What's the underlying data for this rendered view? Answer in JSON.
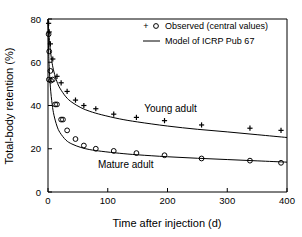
{
  "chart_data": {
    "type": "line",
    "title": "",
    "xlabel": "Time after injection (d)",
    "ylabel": "Total-body retention (%)",
    "xlim": [
      0,
      400
    ],
    "ylim": [
      0,
      80
    ],
    "xticks": [
      0,
      100,
      200,
      300,
      400
    ],
    "yticks": [
      0,
      20,
      40,
      60,
      80
    ],
    "grid": false,
    "legend_position": "top-right",
    "legend": [
      {
        "key": "observed",
        "label": "Observed (central values)",
        "markers": [
          "+",
          "o"
        ]
      },
      {
        "key": "model",
        "label": "Model of ICRP Pub 67",
        "markers": [
          "line"
        ]
      }
    ],
    "annotations": [
      {
        "key": "young-adult",
        "text": "Young adult",
        "x": 205,
        "y": 37
      },
      {
        "key": "mature-adult",
        "text": "Mature adult",
        "x": 130,
        "y": 11
      }
    ],
    "series": [
      {
        "name": "Young adult",
        "marker": "+",
        "observed": {
          "x": [
            1,
            2,
            4,
            8,
            15,
            22,
            32,
            46,
            60,
            80,
            110,
            148,
            195,
            257,
            338,
            390
          ],
          "y": [
            78.0,
            74.0,
            68.5,
            61.5,
            53.5,
            50.5,
            46.5,
            42.5,
            40.0,
            38.5,
            36.0,
            34.5,
            33.0,
            31.0,
            29.5,
            28.5
          ]
        },
        "model": {
          "x": [
            0,
            1,
            2,
            4,
            7,
            10,
            15,
            20,
            30,
            40,
            55,
            70,
            90,
            120,
            150,
            200,
            250,
            300,
            350,
            400
          ],
          "y": [
            80.0,
            75.5,
            71.5,
            65.5,
            59.5,
            55.5,
            51.0,
            48.0,
            44.0,
            41.5,
            39.0,
            37.3,
            35.7,
            33.8,
            32.4,
            30.5,
            29.0,
            27.8,
            26.5,
            25.2
          ]
        }
      },
      {
        "name": "Mature adult",
        "marker": "o",
        "observed": {
          "x": [
            1,
            2,
            4,
            8,
            15,
            22,
            32,
            46,
            60,
            80,
            110,
            148,
            195,
            257,
            338,
            390
          ],
          "y": [
            73.0,
            65.0,
            56.0,
            52.0,
            40.5,
            33.5,
            28.5,
            24.5,
            21.5,
            20.0,
            19.0,
            18.0,
            17.0,
            15.5,
            14.5,
            13.5
          ],
          "x_extra": [
            1.5,
            5,
            12,
            25
          ],
          "y_extra": [
            52.0,
            51.5,
            40.5,
            33.5
          ]
        },
        "model": {
          "x": [
            0,
            1,
            2,
            4,
            7,
            10,
            15,
            20,
            30,
            40,
            55,
            70,
            90,
            120,
            150,
            200,
            250,
            300,
            350,
            400
          ],
          "y": [
            80.0,
            66.0,
            58.0,
            48.5,
            40.5,
            35.5,
            30.5,
            27.5,
            24.0,
            22.2,
            20.6,
            19.6,
            18.8,
            17.9,
            17.2,
            16.3,
            15.6,
            15.0,
            14.4,
            13.8
          ]
        }
      }
    ]
  }
}
